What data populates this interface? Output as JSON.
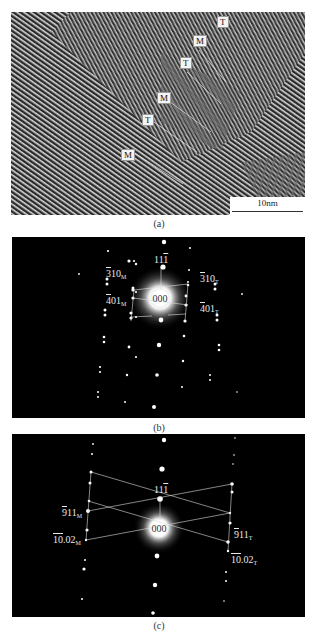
{
  "figure": {
    "panels": [
      {
        "id": "a",
        "caption": "(a)",
        "type": "HRTEM lattice image",
        "labels": [
          {
            "text": "T",
            "x": 206,
            "y": 8
          },
          {
            "text": "M",
            "x": 182,
            "y": 27
          },
          {
            "text": "T",
            "x": 169,
            "y": 49
          },
          {
            "text": "M",
            "x": 147,
            "y": 84
          },
          {
            "text": "T",
            "x": 131,
            "y": 106
          },
          {
            "text": "M",
            "x": 110,
            "y": 141
          }
        ],
        "boundary_lines": [
          [
            188,
            38,
            215,
            70
          ],
          [
            176,
            60,
            210,
            92
          ],
          [
            155,
            87,
            200,
            120
          ],
          [
            140,
            108,
            186,
            140
          ],
          [
            122,
            140,
            172,
            172
          ]
        ],
        "scale_bar": {
          "label": "10nm"
        }
      },
      {
        "id": "b",
        "caption": "(b)",
        "type": "SAED pattern",
        "center_label": "000",
        "indices": [
          {
            "main": "11",
            "bar": "1",
            "pre": "",
            "sub": "",
            "x": 146,
            "y": 20,
            "layout": "top"
          },
          {
            "main": "10",
            "bar": "3",
            "pre": "",
            "sub": "M",
            "x": 94,
            "y": 30
          },
          {
            "main": "10",
            "bar": "3",
            "pre": "",
            "sub": "T",
            "x": 188,
            "y": 35
          },
          {
            "main": "01",
            "bar": "4",
            "pre": "",
            "sub": "M",
            "x": 94,
            "y": 58
          },
          {
            "main": "01",
            "bar": "4",
            "pre": "",
            "sub": "T",
            "x": 188,
            "y": 65
          }
        ]
      },
      {
        "id": "c",
        "caption": "(c)",
        "type": "SAED pattern",
        "center_label": "000",
        "indices": [
          {
            "main": "11",
            "bar": "1",
            "sub": "",
            "x": 146,
            "y": 22,
            "layout": "top"
          },
          {
            "main": "11",
            "bar": "9",
            "sub": "M",
            "x": 51,
            "y": 48
          },
          {
            "main": "11",
            "bar": "9",
            "sub": "T",
            "x": 232,
            "y": 66
          },
          {
            "main": ".02",
            "bar": "10",
            "sub": "M",
            "x": 42,
            "y": 71
          },
          {
            "main": ".02",
            "bar": "10",
            "sub": "T",
            "x": 222,
            "y": 88
          }
        ]
      }
    ]
  }
}
